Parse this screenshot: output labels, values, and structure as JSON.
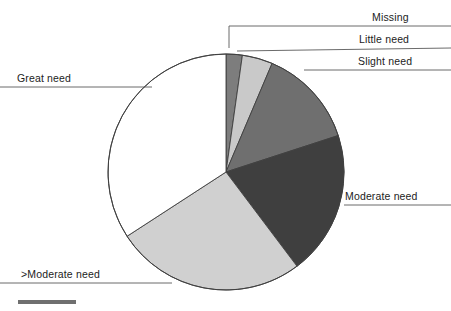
{
  "figure": {
    "background_color": "#ffffff",
    "outline_color": "#404040",
    "leader_line_color": "#5a5a5a",
    "footer_bar": {
      "name": "scale-bar",
      "color": "#6f6f6f",
      "x": 18,
      "y": 300,
      "width": 58,
      "height": 4
    }
  },
  "chart_data": {
    "type": "pie",
    "title": "",
    "subtitle": "",
    "xlabel": "",
    "ylabel": "",
    "grid": false,
    "legend_position": "callout-labels",
    "start_angle_deg": 0,
    "direction": "clockwise",
    "center": {
      "x": 226,
      "y": 172
    },
    "radius": 118,
    "categories": [
      "Missing",
      "Little need",
      "Slight need",
      "Moderate need",
      ">Moderate need",
      "Great need"
    ],
    "values": [
      2.2,
      4.2,
      13.6,
      19.7,
      26.1,
      34.2
    ],
    "units": "percent",
    "slices": [
      {
        "label": "Missing",
        "value": 2.2,
        "color": "#7d7d7d",
        "start_deg": 0.0,
        "end_deg": 8.0
      },
      {
        "label": "Little need",
        "value": 4.2,
        "color": "#c9c9c9",
        "start_deg": 8.0,
        "end_deg": 23.0
      },
      {
        "label": "Slight need",
        "value": 13.6,
        "color": "#6f6f6f",
        "start_deg": 23.0,
        "end_deg": 72.0
      },
      {
        "label": "Moderate need",
        "value": 19.7,
        "color": "#3f3f3f",
        "start_deg": 72.0,
        "end_deg": 143.0
      },
      {
        "label": ">Moderate need",
        "value": 26.1,
        "color": "#d0d0d0",
        "start_deg": 143.0,
        "end_deg": 237.0
      },
      {
        "label": "Great need",
        "value": 34.2,
        "color": "#ffffff",
        "start_deg": 237.0,
        "end_deg": 360.0
      }
    ]
  },
  "callouts": {
    "missing": {
      "label": "Missing",
      "text_x": 372,
      "text_y": 11,
      "line": "M 229 48 L 229 26 L 451 26"
    },
    "little_need": {
      "label": "Little need",
      "text_x": 359,
      "text_y": 33,
      "line": "M 237 51 L 451 48"
    },
    "slight_need": {
      "label": "Slight need",
      "text_x": 358,
      "text_y": 55,
      "line": "M 304 70 L 451 70"
    },
    "moderate_need": {
      "label": "Moderate need",
      "text_x": 345,
      "text_y": 190,
      "line": "M 344 205 L 451 205"
    },
    "great_need": {
      "label": "Great need",
      "text_x": 17,
      "text_y": 72,
      "line": "M 0 87 L 152 87"
    },
    "greater_moderate_need": {
      "label": ">Moderate need",
      "text_x": 21,
      "text_y": 268,
      "line": "M 0 283 L 172 283"
    }
  }
}
